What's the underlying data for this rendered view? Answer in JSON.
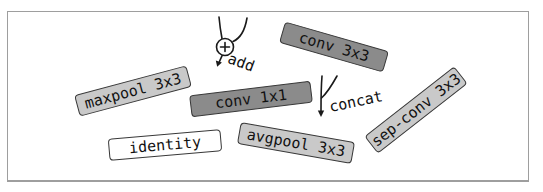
{
  "figure": {
    "colors": {
      "background": "#ffffff",
      "frame_border": "#9e9e9e",
      "box_border": "#383838",
      "box_dark_fill": "#8b8b8b",
      "box_light_fill": "#c9c9c9",
      "box_white_fill": "#ffffff",
      "ink": "#1a1a1a"
    }
  },
  "nodes": [
    {
      "label": "maxpool 3x3",
      "fill": "#c9c9c9",
      "rotation_deg": -15
    },
    {
      "label": "conv 3x3",
      "fill": "#8b8b8b",
      "rotation_deg": 16
    },
    {
      "label": "conv 1x1",
      "fill": "#8b8b8b",
      "rotation_deg": -7
    },
    {
      "label": "identity",
      "fill": "#ffffff",
      "rotation_deg": -5
    },
    {
      "label": "avgpool 3x3",
      "fill": "#c9c9c9",
      "rotation_deg": 10
    },
    {
      "label": "sep-conv 3x3",
      "fill": "#c9c9c9",
      "rotation_deg": -38
    }
  ],
  "combiners": [
    {
      "label": "add",
      "symbol": "plus-circle-with-down-arrow"
    },
    {
      "label": "concat",
      "symbol": "merging-lines-with-down-arrow"
    }
  ]
}
